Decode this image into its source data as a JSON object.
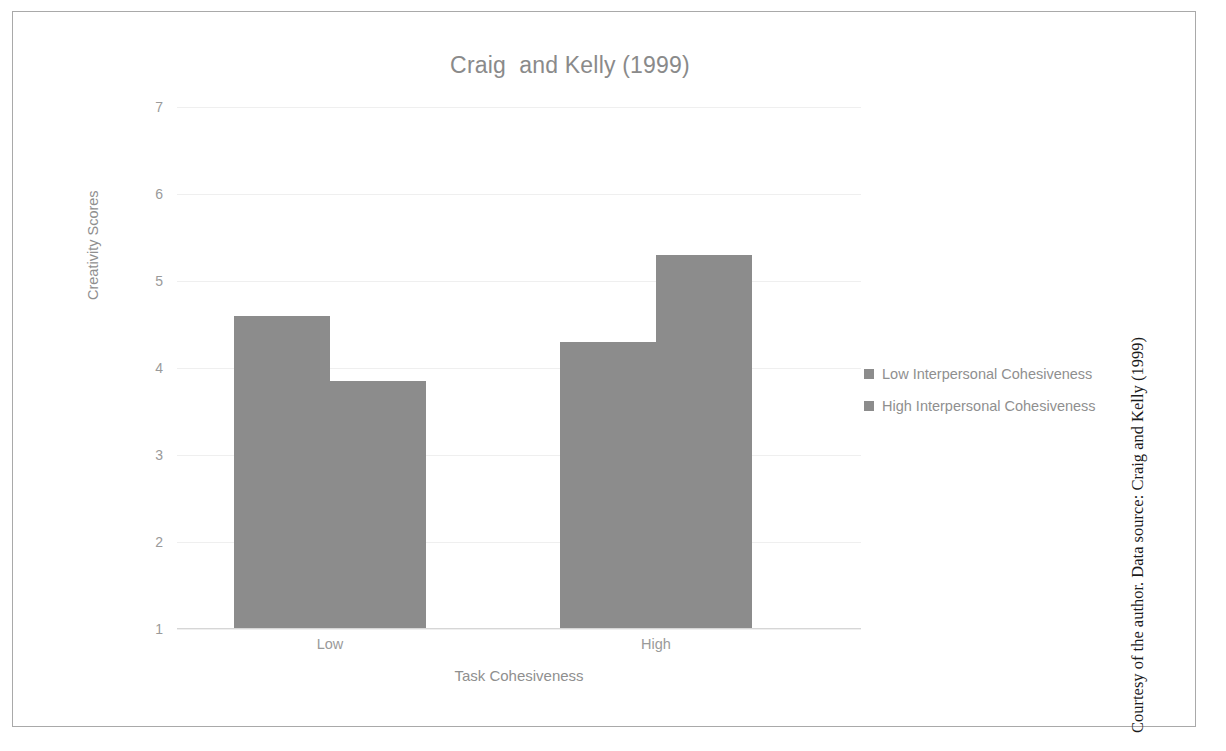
{
  "figure": {
    "title": "Craig  and Kelly (1999)",
    "side_caption": "Courtesy of the author. Data source: Craig and Kelly (1999)",
    "frame_color": "#a9a9a9",
    "background": "#ffffff"
  },
  "chart_data": {
    "type": "bar",
    "title": "Craig  and Kelly (1999)",
    "xlabel": "Task Cohesiveness",
    "ylabel": "Creativity Scores",
    "categories": [
      "Low",
      "High"
    ],
    "series": [
      {
        "name": "Low Interpersonal Cohesiveness",
        "color": "#8c8c8c",
        "values": [
          4.6,
          4.3
        ]
      },
      {
        "name": "High Interpersonal Cohesiveness",
        "color": "#8c8c8c",
        "values": [
          3.85,
          5.3
        ]
      }
    ],
    "ylim": [
      1,
      7
    ],
    "yticks": [
      "7",
      "6",
      "5",
      "4",
      "3",
      "2",
      "1"
    ],
    "ytick_values": [
      7,
      6,
      5,
      4,
      3,
      2,
      1
    ],
    "grid": true,
    "grid_color": "#efefef",
    "legend_position": "right",
    "bar_gap_within_group": 0,
    "axis_color": "#d6d6d6",
    "text_color": "#8f8f8f"
  },
  "legend": {
    "items": [
      {
        "label": "Low Interpersonal Cohesiveness",
        "color": "#8c8c8c"
      },
      {
        "label": "High Interpersonal Cohesiveness",
        "color": "#8c8c8c"
      }
    ]
  }
}
